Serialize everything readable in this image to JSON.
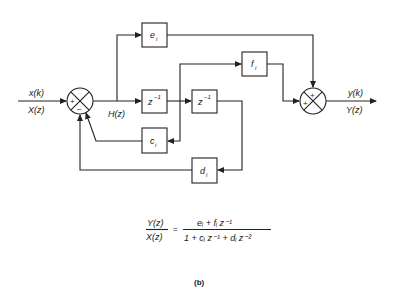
{
  "diagram": {
    "input": {
      "time_label": "x(k)",
      "z_label": "X(z)"
    },
    "output": {
      "time_label": "y(k)",
      "z_label": "Y(z)"
    },
    "intermediate": {
      "label": "H(z)"
    },
    "blocks": {
      "e": {
        "name": "e",
        "sub": "i"
      },
      "f": {
        "name": "f",
        "sub": "i"
      },
      "c": {
        "name": "c",
        "sub": "i"
      },
      "d": {
        "name": "d",
        "sub": "i"
      },
      "delay1": {
        "name": "z",
        "sup": "−1"
      },
      "delay2": {
        "name": "z",
        "sup": "−1"
      }
    },
    "summers": {
      "left": {
        "top_sign": "+",
        "bottom_sign": "−"
      },
      "right": {
        "top_sign": "+",
        "left_sign": "+"
      }
    },
    "transfer_function": {
      "lhs_num": "Y(z)",
      "lhs_den": "X(z)",
      "equals": "=",
      "rhs_num": "eᵢ + fᵢ z⁻¹",
      "rhs_den": "1 + cᵢ z⁻¹ + dᵢ z⁻²"
    },
    "caption": "(b)"
  }
}
